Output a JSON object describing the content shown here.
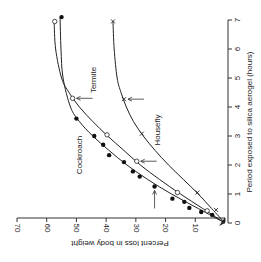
{
  "chart_data": {
    "type": "scatter",
    "title": "",
    "orientation": "rotated 90 degrees clockwise on page",
    "xlabel": "Period exposed to silica aerogel (hours)",
    "ylabel": "Percent loss in body weight",
    "xlim": [
      0,
      7
    ],
    "ylim": [
      0,
      70
    ],
    "x_ticks": [
      "0",
      "1",
      "2",
      "3",
      "4",
      "5",
      "6",
      "7"
    ],
    "y_ticks": [
      "10",
      "20",
      "30",
      "40",
      "50",
      "60",
      "70"
    ],
    "grid": false,
    "legend": "inline labels",
    "series": [
      {
        "name": "Cockroach",
        "marker": "filled-circle",
        "points": [
          [
            0.28,
            4.3
          ],
          [
            0.38,
            8
          ],
          [
            0.52,
            12
          ],
          [
            0.73,
            13.7
          ],
          [
            0.84,
            17.7
          ],
          [
            1.26,
            23.7
          ],
          [
            1.6,
            28.7
          ],
          [
            1.78,
            31
          ],
          [
            2.1,
            34
          ],
          [
            2.34,
            39
          ],
          [
            2.7,
            41
          ],
          [
            3.0,
            44
          ],
          [
            3.6,
            50
          ],
          [
            7.1,
            55
          ]
        ],
        "curve": [
          [
            0,
            0
          ],
          [
            0.5,
            9
          ],
          [
            1,
            18
          ],
          [
            1.5,
            26
          ],
          [
            2,
            33
          ],
          [
            2.5,
            39
          ],
          [
            3,
            44.5
          ],
          [
            3.5,
            49
          ],
          [
            4,
            52
          ],
          [
            5,
            54.5
          ],
          [
            6,
            55.2
          ],
          [
            7.1,
            55.5
          ]
        ],
        "label_pos": [
          82,
          155
        ]
      },
      {
        "name": "Termite",
        "marker": "open-circle",
        "points": [
          [
            0.42,
            6
          ],
          [
            1.05,
            16
          ],
          [
            2.13,
            29.7
          ],
          [
            3.04,
            39.7
          ],
          [
            4.3,
            51.3
          ],
          [
            6.95,
            57.3
          ]
        ],
        "curve": [
          [
            0,
            0
          ],
          [
            0.5,
            7.5
          ],
          [
            1,
            15
          ],
          [
            1.5,
            22
          ],
          [
            2,
            28.5
          ],
          [
            2.5,
            34
          ],
          [
            3,
            39.5
          ],
          [
            3.5,
            44.5
          ],
          [
            4,
            49
          ],
          [
            4.5,
            52.5
          ],
          [
            5,
            55
          ],
          [
            6,
            57
          ],
          [
            6.95,
            57.5
          ]
        ],
        "label_pos": [
          96,
          80
        ]
      },
      {
        "name": "Housefly",
        "marker": "cross",
        "points": [
          [
            0.45,
            3
          ],
          [
            1.05,
            9.3
          ],
          [
            3.08,
            28
          ],
          [
            4.27,
            34
          ],
          [
            6.95,
            37.7
          ]
        ],
        "curve": [
          [
            0,
            0
          ],
          [
            0.5,
            4.5
          ],
          [
            1,
            9
          ],
          [
            1.5,
            14
          ],
          [
            2,
            19
          ],
          [
            2.5,
            23.5
          ],
          [
            3,
            27.5
          ],
          [
            3.5,
            30.8
          ],
          [
            4,
            33.2
          ],
          [
            4.5,
            35
          ],
          [
            5,
            36.3
          ],
          [
            6,
            37.3
          ],
          [
            6.95,
            37.7
          ]
        ],
        "label_pos": [
          160,
          130
        ]
      }
    ],
    "annotations": [
      {
        "type": "arrow",
        "target_series": "Termite",
        "at": [
          4.3,
          51.3
        ]
      },
      {
        "type": "arrow",
        "target_series": "Housefly",
        "at": [
          4.27,
          34
        ]
      },
      {
        "type": "arrow",
        "target_series": "Termite",
        "at": [
          2.13,
          29.7
        ]
      },
      {
        "type": "arrow",
        "target_series": "Cockroach",
        "at": [
          1.26,
          23.7
        ]
      }
    ]
  }
}
